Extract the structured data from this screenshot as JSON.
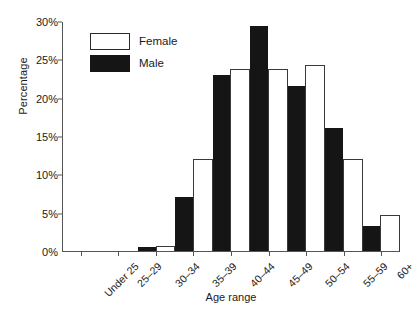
{
  "chart_data": {
    "type": "bar",
    "title": "",
    "xlabel": "Age range",
    "ylabel": "Percentage",
    "categories": [
      "Under 25",
      "25–29",
      "30–34",
      "35–39",
      "40–44",
      "45–49",
      "50–54",
      "55–59",
      "60+"
    ],
    "series": [
      {
        "name": "Female",
        "color": "#ffffff",
        "values": [
          0,
          0,
          0.7,
          12.0,
          23.7,
          23.7,
          24.3,
          12.0,
          4.7
        ]
      },
      {
        "name": "Male",
        "color": "#151515",
        "values": [
          0,
          0,
          0.5,
          7.1,
          23.0,
          29.3,
          21.5,
          16.0,
          3.3
        ]
      }
    ],
    "ylim": [
      0,
      30
    ],
    "yticks": [
      0,
      5,
      10,
      15,
      20,
      25,
      30
    ],
    "ytick_labels": [
      "0%",
      "5%",
      "10%",
      "15%",
      "20%",
      "25%",
      "30%"
    ],
    "grid": false,
    "legend_position": "upper-left-inside"
  },
  "legend": {
    "entries": [
      {
        "label": "Female",
        "swatch": "female"
      },
      {
        "label": "Male",
        "swatch": "male"
      }
    ]
  }
}
